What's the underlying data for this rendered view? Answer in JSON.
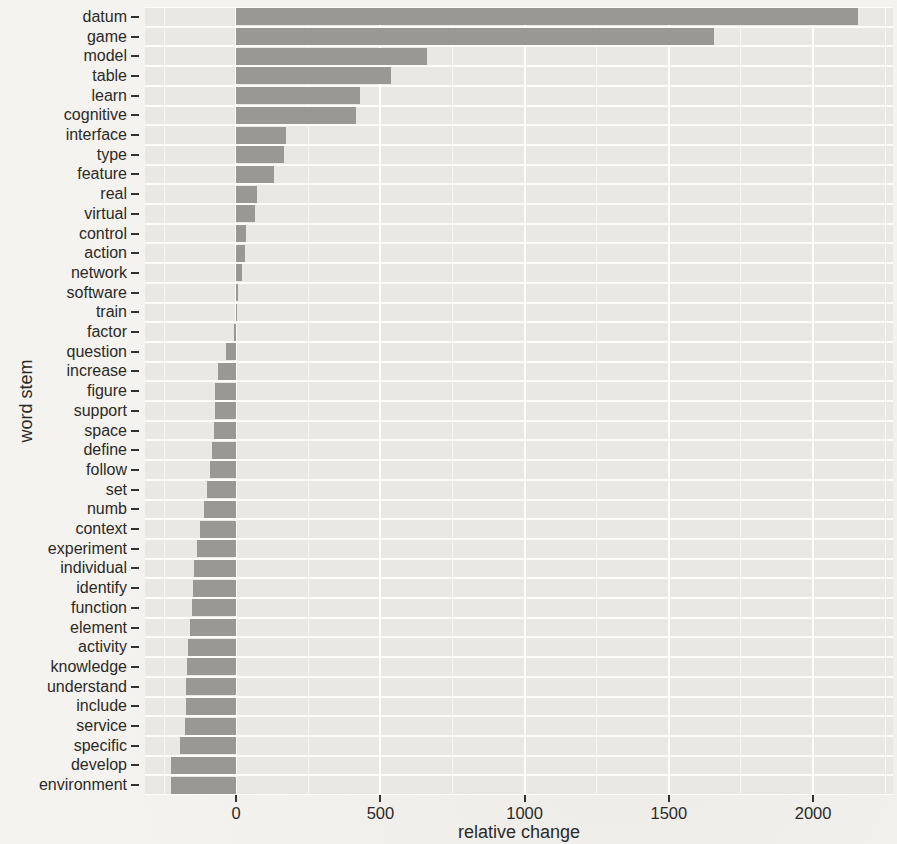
{
  "chart_data": {
    "type": "bar",
    "orientation": "horizontal",
    "title": "",
    "xlabel": "relative change",
    "ylabel": "word stem",
    "xlim": [
      -316,
      2277
    ],
    "xticks": [
      0,
      500,
      1000,
      1500,
      2000
    ],
    "minor_gridlines": [
      -250,
      250,
      750,
      1250,
      1750,
      2250
    ],
    "grid": "white gridlines on gray panel",
    "legend_position": "none",
    "categories": [
      "datum",
      "game",
      "model",
      "table",
      "learn",
      "cognitive",
      "interface",
      "type",
      "feature",
      "real",
      "virtual",
      "control",
      "action",
      "network",
      "software",
      "train",
      "factor",
      "question",
      "increase",
      "figure",
      "support",
      "space",
      "define",
      "follow",
      "set",
      "numb",
      "context",
      "experiment",
      "individual",
      "identify",
      "function",
      "element",
      "activity",
      "knowledge",
      "understand",
      "include",
      "service",
      "specific",
      "develop",
      "environment"
    ],
    "values": [
      2155,
      1655,
      660,
      537,
      430,
      415,
      173,
      166,
      132,
      73,
      66,
      35,
      31,
      21,
      5,
      -2,
      -8,
      -36,
      -63,
      -72,
      -73,
      -76,
      -84,
      -90,
      -100,
      -112,
      -126,
      -136,
      -145,
      -150,
      -154,
      -161,
      -167,
      -171,
      -173,
      -175,
      -178,
      -196,
      -226,
      -227
    ],
    "colors": {
      "bar": "#9a9895",
      "panel_background": "#eae8e4",
      "gridline": "#ffffff",
      "text": "#2b2a28",
      "tick_mark": "#333230",
      "page_background": "#f5f3ef"
    }
  }
}
